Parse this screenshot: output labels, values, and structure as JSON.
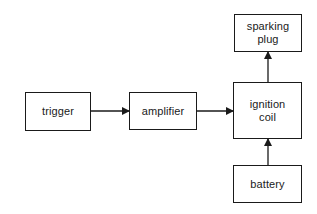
{
  "diagram": {
    "type": "block-diagram",
    "nodes": [
      {
        "id": "trigger",
        "label": "trigger"
      },
      {
        "id": "amplifier",
        "label": "amplifier"
      },
      {
        "id": "ignition_coil",
        "label": "ignition\ncoil"
      },
      {
        "id": "sparking_plug",
        "label": "sparking\nplug"
      },
      {
        "id": "battery",
        "label": "battery"
      }
    ],
    "edges": [
      {
        "from": "trigger",
        "to": "amplifier"
      },
      {
        "from": "amplifier",
        "to": "ignition_coil"
      },
      {
        "from": "ignition_coil",
        "to": "sparking_plug"
      },
      {
        "from": "battery",
        "to": "ignition_coil"
      }
    ]
  },
  "colors": {
    "line": "#1a1a1a",
    "background": "#ffffff"
  }
}
